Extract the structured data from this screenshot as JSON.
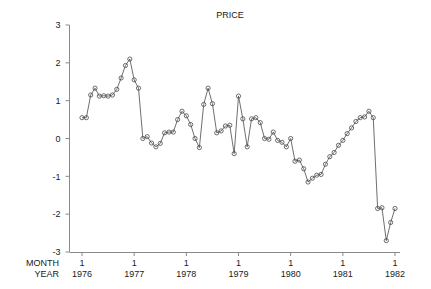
{
  "chart_data": {
    "type": "line",
    "title": "PRICE",
    "xlabel": "",
    "ylabel": "",
    "grid": false,
    "legend": null,
    "marker": "open-circle",
    "ylim": [
      -3,
      3
    ],
    "yticks": [
      3,
      2,
      1,
      0,
      -1,
      -2,
      -3
    ],
    "ytick_labels": [
      "3",
      "2",
      "1",
      "0",
      "-1",
      "-2",
      "-3"
    ],
    "xlim": [
      1976.0,
      1982.0
    ],
    "xticks": [
      1976,
      1977,
      1978,
      1979,
      1980,
      1981,
      1982
    ],
    "xtick_month_labels": [
      "1",
      "1",
      "1",
      "1",
      "1",
      "1",
      "1"
    ],
    "xtick_year_labels": [
      "1976",
      "1977",
      "1978",
      "1979",
      "1980",
      "1981",
      "1982"
    ],
    "x_axis_row_labels": [
      "MONTH",
      "YEAR"
    ],
    "x": [
      1976.0,
      1976.083,
      1976.167,
      1976.25,
      1976.333,
      1976.417,
      1976.5,
      1976.583,
      1976.667,
      1976.75,
      1976.833,
      1976.917,
      1977.0,
      1977.083,
      1977.167,
      1977.25,
      1977.333,
      1977.417,
      1977.5,
      1977.583,
      1977.667,
      1977.75,
      1977.833,
      1977.917,
      1978.0,
      1978.083,
      1978.167,
      1978.25,
      1978.333,
      1978.417,
      1978.5,
      1978.583,
      1978.667,
      1978.75,
      1978.833,
      1978.917,
      1979.0,
      1979.083,
      1979.167,
      1979.25,
      1979.333,
      1979.417,
      1979.5,
      1979.583,
      1979.667,
      1979.75,
      1979.833,
      1979.917,
      1980.0,
      1980.083,
      1980.167,
      1980.25,
      1980.333,
      1980.417,
      1980.5,
      1980.583,
      1980.667,
      1980.75,
      1980.833,
      1980.917,
      1981.0,
      1981.083,
      1981.167,
      1981.25,
      1981.333,
      1981.417,
      1981.5,
      1981.583,
      1981.667,
      1981.75,
      1981.833,
      1981.917,
      1982.0
    ],
    "values": [
      0.55,
      0.55,
      1.15,
      1.33,
      1.12,
      1.13,
      1.12,
      1.15,
      1.3,
      1.6,
      1.93,
      2.1,
      1.55,
      1.33,
      0.0,
      0.05,
      -0.12,
      -0.22,
      -0.13,
      0.15,
      0.17,
      0.17,
      0.5,
      0.72,
      0.6,
      0.37,
      0.0,
      -0.24,
      0.9,
      1.33,
      0.92,
      0.15,
      0.2,
      0.33,
      0.35,
      -0.4,
      1.12,
      0.52,
      -0.22,
      0.52,
      0.55,
      0.42,
      0.0,
      -0.02,
      0.17,
      -0.05,
      -0.1,
      -0.22,
      0.0,
      -0.6,
      -0.57,
      -0.8,
      -1.15,
      -1.05,
      -0.97,
      -0.95,
      -0.68,
      -0.48,
      -0.37,
      -0.18,
      -0.05,
      0.13,
      0.28,
      0.45,
      0.55,
      0.57,
      0.72,
      0.55,
      -1.85,
      -1.83,
      -2.7,
      -2.22,
      -2.2
    ],
    "values_tail": [
      -1.85,
      -0.97,
      -1.68,
      -1.65,
      -0.95,
      -1.08,
      -0.97
    ],
    "n_points": 73,
    "series_color": "#555555",
    "axis_color": "#888888",
    "background": "#ffffff"
  },
  "figure": {
    "title": "PRICE",
    "axis_label_month": "MONTH",
    "axis_label_year": "YEAR"
  }
}
